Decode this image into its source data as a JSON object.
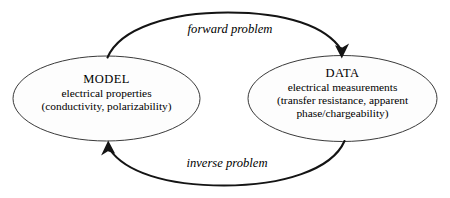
{
  "diagram": {
    "background_color": "#ffffff",
    "stroke_color": "#141414",
    "node_fill_color": "#fdfdfd",
    "node_stroke_color": "#3a3a3a",
    "nodes": {
      "model": {
        "title": "MODEL",
        "line1": "electrical properties",
        "line2": "(conductivity, polarizability)"
      },
      "data": {
        "title": "DATA",
        "line1": "electrical measurements",
        "line2": "(transfer resistance, apparent",
        "line3": "phase/chargeability)"
      }
    },
    "edges": {
      "forward": {
        "label": "forward problem",
        "direction": "model-to-data"
      },
      "inverse": {
        "label": "inverse problem",
        "direction": "data-to-model"
      }
    }
  }
}
